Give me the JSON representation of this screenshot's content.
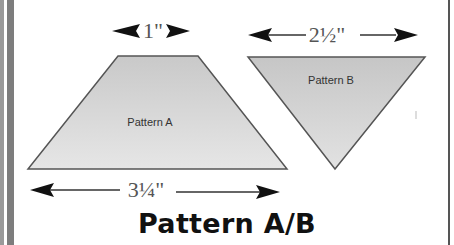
{
  "title": "Pattern A/B",
  "colors": {
    "shape_fill": "#d4d4d4",
    "shape_stroke": "#555555",
    "arrow": "#111111",
    "dim_text": "#555555"
  },
  "patterns": [
    {
      "label": "Pattern A",
      "shape": "trapezoid",
      "top_dimension": "1\"",
      "bottom_dimension": "3¼\""
    },
    {
      "label": "Pattern B",
      "shape": "inverted-triangle",
      "top_dimension": "2½\""
    }
  ]
}
